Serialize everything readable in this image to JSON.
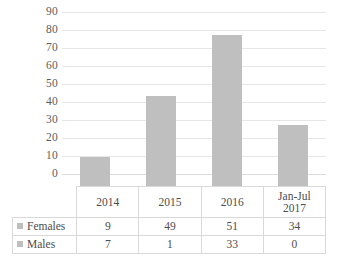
{
  "chart_data": {
    "type": "bar",
    "title": "",
    "xlabel": "",
    "ylabel": "",
    "ylim": [
      0,
      90
    ],
    "ytick_step": 10,
    "yticks": [
      "90",
      "80",
      "70",
      "60",
      "50",
      "40",
      "30",
      "20",
      "10",
      "0"
    ],
    "grid": true,
    "legend_position": "data-table-left",
    "categories": [
      "2014",
      "2015",
      "2016",
      "Jan-Jul 2017"
    ],
    "values": [
      16,
      50,
      84,
      34
    ],
    "series": [
      {
        "name": "Females",
        "values": [
          9,
          49,
          51,
          34
        ]
      },
      {
        "name": "Males",
        "values": [
          7,
          1,
          33,
          0
        ]
      }
    ],
    "bar_color": "#bfbfbf",
    "gridline_color": "#e6e6e6"
  },
  "axis": {
    "ticks": [
      {
        "label": "90",
        "value": 90
      },
      {
        "label": "80",
        "value": 80
      },
      {
        "label": "70",
        "value": 70
      },
      {
        "label": "60",
        "value": 60
      },
      {
        "label": "50",
        "value": 50
      },
      {
        "label": "40",
        "value": 40
      },
      {
        "label": "30",
        "value": 30
      },
      {
        "label": "20",
        "value": 20
      },
      {
        "label": "10",
        "value": 10
      },
      {
        "label": "0",
        "value": 0
      }
    ]
  },
  "bars": [
    {
      "category": "2014",
      "total": 16
    },
    {
      "category": "2015",
      "total": 50
    },
    {
      "category": "2016",
      "total": 84
    },
    {
      "category": "Jan-Jul 2017",
      "total": 34
    }
  ],
  "table": {
    "legend_header": "",
    "category_headers": [
      {
        "line1": "2014",
        "line2": ""
      },
      {
        "line1": "2015",
        "line2": ""
      },
      {
        "line1": "2016",
        "line2": ""
      },
      {
        "line1": "Jan-Jul",
        "line2": "2017"
      }
    ],
    "rows": [
      {
        "label": "Females",
        "marker_color": "#bfbfbf",
        "cells": [
          "9",
          "49",
          "51",
          "34"
        ]
      },
      {
        "label": "Males",
        "marker_color": "#bfbfbf",
        "cells": [
          "7",
          "1",
          "33",
          "0"
        ]
      }
    ]
  }
}
